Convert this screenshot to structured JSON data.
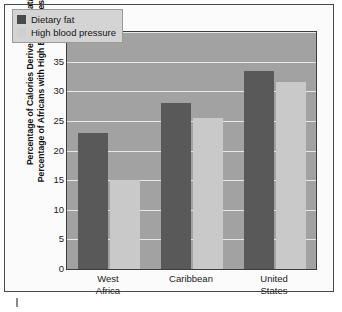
{
  "chart_data": {
    "type": "bar",
    "title": "",
    "xlabel": "",
    "ylabel_line1": "Percentage of Calories Derived from Fat/",
    "ylabel_line2": "Percentage of Africans with High Blood Pressure",
    "categories": [
      "West Africa",
      "Caribbean",
      "United States"
    ],
    "category_lines": [
      [
        "West",
        "Africa"
      ],
      [
        "Caribbean"
      ],
      [
        "United",
        "States"
      ]
    ],
    "series": [
      {
        "name": "Dietary fat",
        "values": [
          23,
          28,
          33.5
        ],
        "color": "#595959"
      },
      {
        "name": "High blood pressure",
        "values": [
          15,
          25.5,
          31.5
        ],
        "color": "#c9c9c9"
      }
    ],
    "ylim": [
      0,
      40
    ],
    "yticks": [
      0,
      5,
      10,
      15,
      20,
      25,
      30,
      35,
      40
    ],
    "ytick_labels": [
      "0",
      "5",
      "10",
      "15",
      "20",
      "25",
      "30",
      "35",
      "40"
    ],
    "grid": true,
    "legend_position": "upper left",
    "plot_background": "#a2a2a2",
    "gridline_color": "#e8e8e8",
    "frame_color": "#4a4a4a"
  },
  "legend": {
    "items": [
      {
        "label": "Dietary fat",
        "swatch": "dark"
      },
      {
        "label": "High blood pressure",
        "swatch": "light"
      }
    ]
  }
}
